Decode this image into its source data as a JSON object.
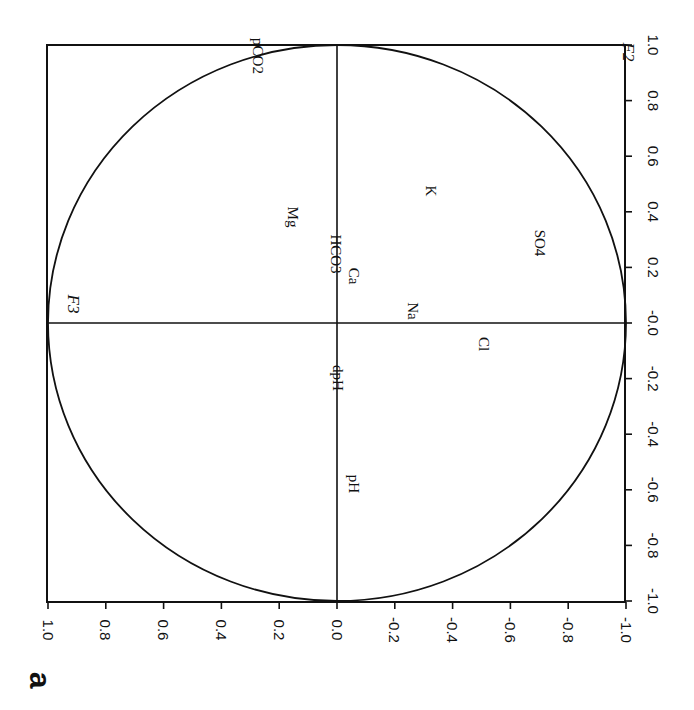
{
  "figure": {
    "panel_label": "a",
    "ink_color": "#111111",
    "background": "#ffffff"
  },
  "chart_data": {
    "type": "scatter",
    "title": "",
    "subtitle": "Correlation circle (factor loadings), figure rotated 90 degrees",
    "xlabel": "F2",
    "ylabel": "F3",
    "rotation_deg": 90,
    "axis_right": {
      "name": "F2",
      "range": [
        -1.0,
        1.0
      ],
      "ticks": [
        "1.0",
        "0.8",
        "0.6",
        "0.4",
        "0.2",
        "-0.0",
        "-0.2",
        "-0.4",
        "-0.6",
        "-0.8",
        "-1.0"
      ]
    },
    "axis_bottom": {
      "name": "F3",
      "range": [
        1.0,
        -1.0
      ],
      "ticks": [
        "1.0",
        "0.8",
        "0.6",
        "0.4",
        "0.2",
        "0.0",
        "-0.2",
        "-0.4",
        "-0.6",
        "-0.8",
        "-1.0"
      ]
    },
    "unit_circle": true,
    "grid": false,
    "legend": null,
    "points": [
      {
        "label": "pCO2",
        "F2": 0.96,
        "F3": 0.27,
        "px": 258,
        "py": 56
      },
      {
        "label": "Mg",
        "F2": 0.38,
        "F3": 0.15,
        "px": 293,
        "py": 217
      },
      {
        "label": "HCO3",
        "F2": 0.25,
        "F3": 0.0,
        "px": 336,
        "py": 254
      },
      {
        "label": "Ca",
        "F2": 0.17,
        "F3": -0.06,
        "px": 354,
        "py": 276
      },
      {
        "label": "K",
        "F2": 0.47,
        "F3": -0.33,
        "px": 431,
        "py": 191
      },
      {
        "label": "SO4",
        "F2": 0.29,
        "F3": -0.7,
        "px": 540,
        "py": 243
      },
      {
        "label": "Na",
        "F2": 0.04,
        "F3": -0.26,
        "px": 413,
        "py": 311
      },
      {
        "label": "Cl",
        "F2": -0.08,
        "F3": -0.51,
        "px": 484,
        "py": 344
      },
      {
        "label": "dpH",
        "F2": -0.2,
        "F3": 0.0,
        "px": 338,
        "py": 378
      },
      {
        "label": "pH",
        "F2": -0.58,
        "F3": -0.06,
        "px": 354,
        "py": 484
      }
    ],
    "axis_labels": [
      {
        "label": "F2",
        "px": 628,
        "py": 52,
        "italic": true
      },
      {
        "label": "F3",
        "px": 73,
        "py": 304,
        "italic": true
      }
    ]
  },
  "layout": {
    "frame": {
      "left": 47,
      "top": 45,
      "right": 625,
      "bottom": 602
    },
    "center": {
      "x": 337,
      "y": 323
    },
    "scale": {
      "x": 289,
      "y": 278
    }
  }
}
